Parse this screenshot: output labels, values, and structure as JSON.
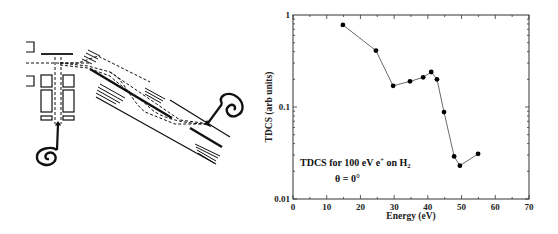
{
  "chart_data": {
    "type": "line",
    "title": "",
    "annotation_line1": "TDCS for 100 eV e",
    "annotation_sup": "+",
    "annotation_on": " on H",
    "annotation_sub": "2",
    "annotation_line2": "θ = 0°",
    "xlabel": "Energy (eV)",
    "ylabel": "TDCS (arb units)",
    "xlim": [
      0,
      70
    ],
    "ylim": [
      0.01,
      1
    ],
    "yscale": "log",
    "x_ticks": [
      "0",
      "10",
      "20",
      "30",
      "40",
      "50",
      "60",
      "70"
    ],
    "y_ticks": [
      "0.01",
      "0.1",
      "1"
    ],
    "grid": false,
    "legend": null,
    "series": [
      {
        "name": "TDCS",
        "marker": "filled-circle",
        "x": [
          14.8,
          24.6,
          29.7,
          34.7,
          38.6,
          41.0,
          42.7,
          44.8,
          47.8,
          49.5,
          54.9
        ],
        "y": [
          0.78,
          0.41,
          0.17,
          0.19,
          0.21,
          0.24,
          0.2,
          0.088,
          0.029,
          0.023,
          0.031
        ]
      }
    ]
  }
}
